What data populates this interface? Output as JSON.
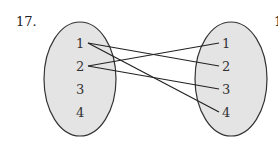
{
  "problem_number": "17.",
  "domain_set": {
    "elements": [
      "1",
      "2",
      "3",
      "4"
    ],
    "fill": "#e4e4e4",
    "stroke": "#333333"
  },
  "codomain_set": {
    "elements": [
      "1",
      "2",
      "3",
      "4"
    ],
    "fill": "#e4e4e4",
    "stroke": "#333333"
  },
  "mappings": [
    {
      "from": "1",
      "to": "2"
    },
    {
      "from": "1",
      "to": "4"
    },
    {
      "from": "2",
      "to": "1"
    },
    {
      "from": "2",
      "to": "3"
    }
  ],
  "right_edge_fragment": "1"
}
